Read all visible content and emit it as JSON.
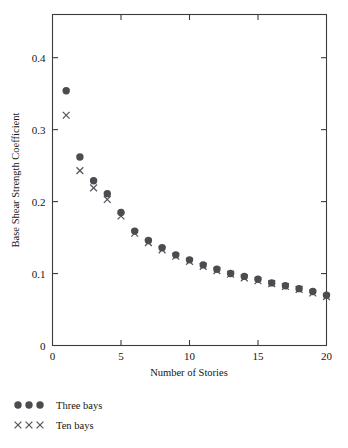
{
  "chart_data": {
    "type": "scatter",
    "title": "",
    "xlabel": "Number of Stories",
    "ylabel": "Base Shear Strength Coefficient",
    "xlim": [
      0,
      20
    ],
    "ylim": [
      0,
      0.46
    ],
    "xticks": [
      0,
      5,
      10,
      15,
      20
    ],
    "xtick_labels": [
      "0",
      "5",
      "10",
      "15",
      "20"
    ],
    "yticks": [
      0,
      0.1,
      0.2,
      0.3,
      0.4
    ],
    "ytick_labels": [
      "0",
      "0.1",
      "0.2",
      "0.3",
      "0.4"
    ],
    "grid": false,
    "legend_position": "below-left",
    "x": [
      1,
      2,
      3,
      4,
      5,
      6,
      7,
      8,
      9,
      10,
      11,
      12,
      13,
      14,
      15,
      16,
      17,
      18,
      19,
      20
    ],
    "series": [
      {
        "name": "Three bays",
        "marker": "circle",
        "color": "#4b4b50",
        "values": [
          0.354,
          0.262,
          0.229,
          0.211,
          0.185,
          0.159,
          0.146,
          0.136,
          0.126,
          0.119,
          0.112,
          0.106,
          0.1,
          0.096,
          0.092,
          0.087,
          0.083,
          0.079,
          0.075,
          0.07
        ]
      },
      {
        "name": "Ten bays",
        "marker": "cross",
        "color": "#55555a",
        "values": [
          0.32,
          0.243,
          0.219,
          0.203,
          0.18,
          0.156,
          0.143,
          0.133,
          0.124,
          0.117,
          0.11,
          0.104,
          0.099,
          0.094,
          0.09,
          0.086,
          0.082,
          0.078,
          0.073,
          0.068
        ]
      }
    ]
  },
  "legend": {
    "entries": [
      {
        "label": "Three bays",
        "marker": "circle"
      },
      {
        "label": "Ten bays",
        "marker": "cross"
      }
    ]
  },
  "axes": {
    "x_title": "Number of Stories",
    "y_title": "Base Shear Strength Coefficient"
  }
}
